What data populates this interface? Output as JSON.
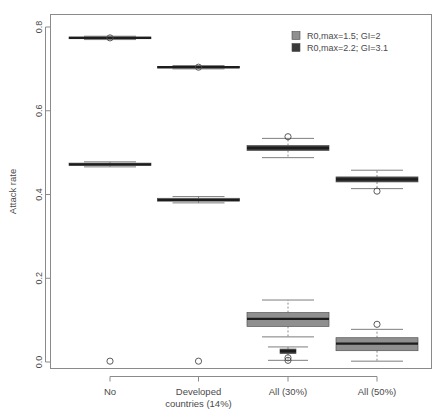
{
  "figure": {
    "background": "#ffffff",
    "frame_color": "#8a8a8a",
    "text_color": "#4a4a4a"
  },
  "axes": {
    "ylabel": "Attack rate",
    "yticks": [
      "0.0",
      "0.2",
      "0.4",
      "0.6",
      "0.8"
    ],
    "ytick_values": [
      0.0,
      0.2,
      0.4,
      0.6,
      0.8
    ],
    "xlabel": "",
    "categories": [
      "No",
      "Developed\ncountries (14%)",
      "All (30%)",
      "All (50%)"
    ],
    "category_lines": [
      [
        "No"
      ],
      [
        "Developed",
        "countries (14%)"
      ],
      [
        "All (30%)"
      ],
      [
        "All (50%)"
      ]
    ]
  },
  "legend": {
    "position": "top-right",
    "entries": [
      {
        "label": "R0,max=1.5; GI=2",
        "color": "#8f8f8f",
        "swatch": "light-gray-square"
      },
      {
        "label": "R0,max=2.2; GI=3.1",
        "color": "#3a3a3a",
        "swatch": "dark-gray-square"
      }
    ]
  },
  "chart_data": {
    "type": "box",
    "title": "",
    "xlabel": "",
    "ylabel": "Attack rate",
    "ylim": [
      0.0,
      0.82
    ],
    "grid": false,
    "legend_position": "top-right",
    "categories": [
      "No",
      "Developed countries (14%)",
      "All (30%)",
      "All (50%)"
    ],
    "series": [
      {
        "name": "R0,max=1.5; GI=2",
        "color": "#8f8f8f",
        "boxes": [
          {
            "category": "No",
            "whisker_low": 0.466,
            "q1": 0.469,
            "median": 0.472,
            "q3": 0.475,
            "whisker_high": 0.478,
            "outliers": [
              0.002
            ]
          },
          {
            "category": "Developed countries (14%)",
            "whisker_low": 0.38,
            "q1": 0.384,
            "median": 0.387,
            "q3": 0.391,
            "whisker_high": 0.395,
            "outliers": [
              0.002
            ]
          },
          {
            "category": "All (30%)",
            "whisker_low": 0.06,
            "q1": 0.085,
            "median": 0.103,
            "q3": 0.118,
            "whisker_high": 0.148,
            "outliers": []
          },
          {
            "category": "All (50%)",
            "whisker_low": 0.002,
            "q1": 0.027,
            "median": 0.044,
            "q3": 0.058,
            "whisker_high": 0.078,
            "outliers": [
              0.09
            ]
          }
        ]
      },
      {
        "name": "R0,max=2.2; GI=3.1",
        "color": "#3a3a3a",
        "boxes": [
          {
            "category": "No",
            "whisker_low": 0.77,
            "q1": 0.772,
            "median": 0.774,
            "q3": 0.776,
            "whisker_high": 0.778,
            "outliers": [
              0.774
            ]
          },
          {
            "category": "Developed countries (14%)",
            "whisker_low": 0.7,
            "q1": 0.702,
            "median": 0.704,
            "q3": 0.706,
            "whisker_high": 0.708,
            "outliers": [
              0.704
            ]
          },
          {
            "category": "All (30%)",
            "whisker_low": 0.488,
            "q1": 0.505,
            "median": 0.511,
            "q3": 0.517,
            "whisker_high": 0.534,
            "outliers": [
              0.538
            ]
          },
          {
            "category": "All (50%)",
            "whisker_low": 0.414,
            "q1": 0.43,
            "median": 0.436,
            "q3": 0.442,
            "whisker_high": 0.458,
            "outliers": [
              0.408
            ]
          }
        ]
      }
    ],
    "extra_boxes": [
      {
        "category": "All (30%)",
        "series": "R0,max=2.2; GI=3.1",
        "whisker_low": 0.004,
        "q1": 0.02,
        "median": 0.026,
        "q3": 0.031,
        "whisker_high": 0.036,
        "outliers": [
          0.01,
          0.004
        ],
        "note": "low cluster"
      }
    ]
  }
}
